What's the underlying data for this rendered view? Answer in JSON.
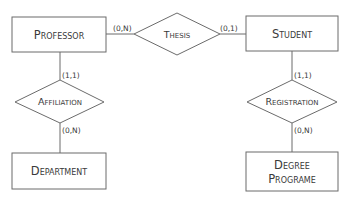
{
  "diagram": {
    "type": "er-diagram",
    "entities": [
      {
        "id": "professor",
        "label": "Professor"
      },
      {
        "id": "student",
        "label": "Student"
      },
      {
        "id": "department",
        "label": "Department"
      },
      {
        "id": "degree_programe",
        "label_line1": "Degree",
        "label_line2": "Programe"
      }
    ],
    "relationships": [
      {
        "id": "thesis",
        "label": "Thesis"
      },
      {
        "id": "affiliation",
        "label": "Affiliation"
      },
      {
        "id": "registration",
        "label": "Registration"
      }
    ],
    "cardinalities": {
      "professor_thesis": "(0,N)",
      "student_thesis": "(0,1)",
      "professor_affiliation": "(1,1)",
      "department_affiliation": "(0,N)",
      "student_registration": "(1,1)",
      "degree_registration": "(0,N)"
    }
  }
}
